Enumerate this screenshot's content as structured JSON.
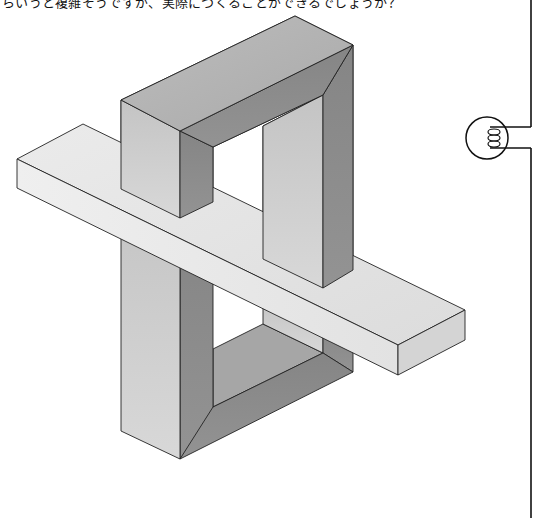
{
  "page": {
    "caption_text": "らいうと複雑そうですが、実際につくることができるでしょうか？",
    "figure": {
      "name": "impossible-figure",
      "description": "Impossible object: rectangular frame pierced by a flat plank",
      "colors": {
        "top_face": "#b8b8b8",
        "dark_face": "#8c8c8c",
        "light_face": "#d2d2d2",
        "plank_top": "#e4e4e4",
        "plank_front": "#ececec",
        "plank_end": "#d6d6d6",
        "edge": "#222222"
      }
    },
    "margin_marker": {
      "icon": "binding-ring-icon",
      "line_color": "#111111"
    }
  }
}
